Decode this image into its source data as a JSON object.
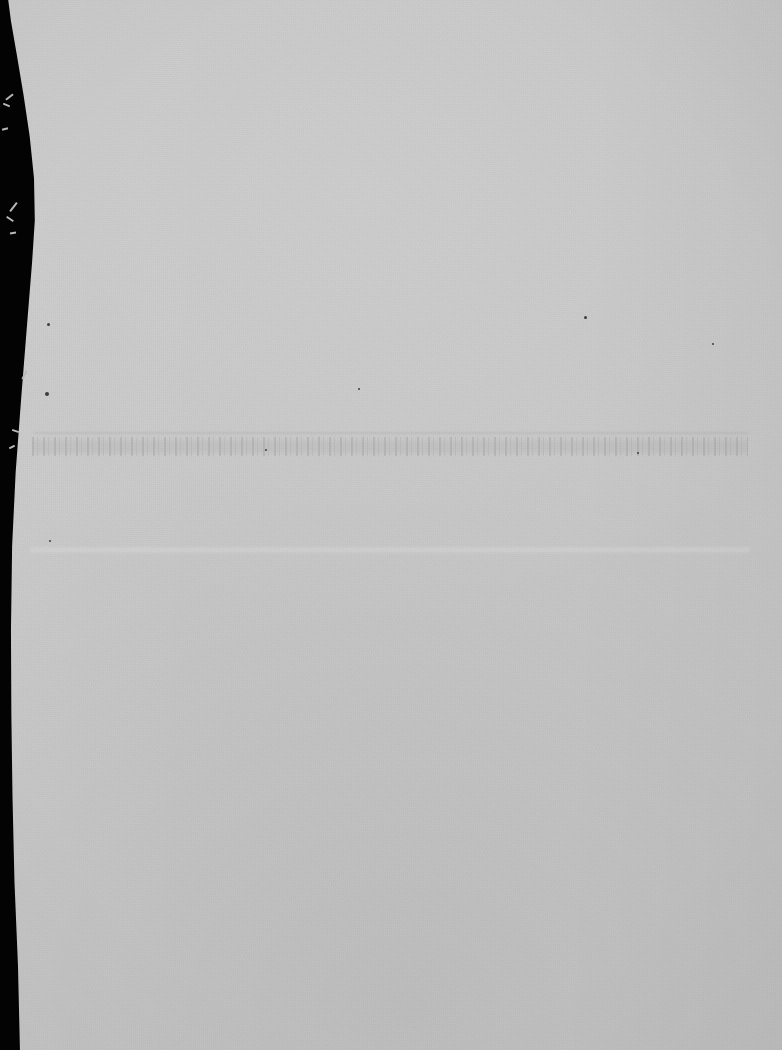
{
  "document": {
    "kind": "scanned-page",
    "legible_text": "",
    "note": "Overexposed blank scan; no legible text rendered in the pixels."
  },
  "canvas": {
    "width_px": 782,
    "height_px": 1050
  },
  "colors": {
    "scanner_backdrop": "#030303",
    "paper_surface": "#c5c5c5",
    "ghost_text": "#8c8c8c",
    "speck": "#3c3c3c",
    "edge_fibre": "#b9b9b9"
  },
  "regions": {
    "ghost_text_row": {
      "label": "",
      "x": 32,
      "y": 437,
      "width": 716,
      "height": 19
    },
    "faint_rule": {
      "label": "",
      "x": 34,
      "y": 432,
      "width": 714,
      "height": 2
    },
    "faint_band": {
      "label": "",
      "x": 30,
      "y": 546,
      "width": 720,
      "height": 8
    }
  },
  "specks": [
    {
      "x": 47,
      "y": 323,
      "size": 3
    },
    {
      "x": 45,
      "y": 392,
      "size": 4
    },
    {
      "x": 584,
      "y": 316,
      "size": 3
    },
    {
      "x": 358,
      "y": 388,
      "size": 2
    },
    {
      "x": 712,
      "y": 343,
      "size": 2
    },
    {
      "x": 49,
      "y": 540,
      "size": 2
    },
    {
      "x": 265,
      "y": 449,
      "size": 2
    },
    {
      "x": 637,
      "y": 452,
      "size": 2
    }
  ],
  "edge_fibres": [
    {
      "x": 5,
      "y": 96,
      "width": 9,
      "height": 2,
      "rotate": -38
    },
    {
      "x": 3,
      "y": 104,
      "width": 7,
      "height": 2,
      "rotate": 22
    },
    {
      "x": 2,
      "y": 128,
      "width": 6,
      "height": 2,
      "rotate": -14
    },
    {
      "x": 8,
      "y": 206,
      "width": 11,
      "height": 2,
      "rotate": -52
    },
    {
      "x": 6,
      "y": 218,
      "width": 8,
      "height": 2,
      "rotate": 34
    },
    {
      "x": 10,
      "y": 232,
      "width": 6,
      "height": 2,
      "rotate": -8
    },
    {
      "x": 20,
      "y": 374,
      "width": 9,
      "height": 2,
      "rotate": -62
    },
    {
      "x": 12,
      "y": 430,
      "width": 7,
      "height": 2,
      "rotate": 18
    },
    {
      "x": 9,
      "y": 446,
      "width": 6,
      "height": 2,
      "rotate": -26
    }
  ]
}
